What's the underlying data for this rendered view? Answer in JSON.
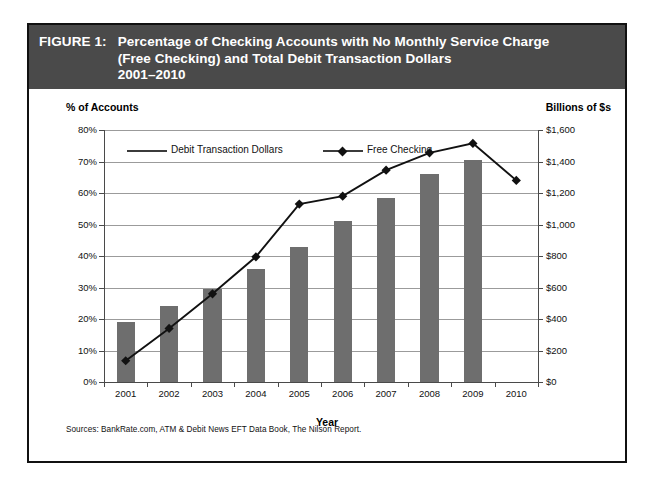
{
  "figure": {
    "label": "FIGURE 1:",
    "title_lines": [
      "Percentage of Checking Accounts with No Monthly Service Charge",
      "(Free Checking) and Total Debit Transaction Dollars",
      "2001–2010"
    ],
    "source_note": "Sources: BankRate.com, ATM & Debit News EFT Data Book, The Nilson Report.",
    "banner_color": "#4a4a4a",
    "bar_color": "#6e6e6e",
    "line_color": "#111111"
  },
  "legend": {
    "items": [
      {
        "label": "Debit Transaction Dollars",
        "marker": "line"
      },
      {
        "label": "Free Checking",
        "marker": "line-diamond"
      }
    ]
  },
  "chart_data": {
    "type": "bar",
    "title": "Percentage of Checking Accounts with No Monthly Service Charge (Free Checking) and Total Debit Transaction Dollars 2001–2010",
    "xlabel": "Year",
    "ylabel": "% of Accounts",
    "y2label": "Billions of $s",
    "categories": [
      "2001",
      "2002",
      "2003",
      "2004",
      "2005",
      "2006",
      "2007",
      "2008",
      "2009",
      "2010"
    ],
    "ylim": [
      0,
      80
    ],
    "y2lim": [
      0,
      1600
    ],
    "yticks": [
      "0%",
      "10%",
      "20%",
      "30%",
      "40%",
      "50%",
      "60%",
      "70%",
      "80%"
    ],
    "ytick_values": [
      0,
      10,
      20,
      30,
      40,
      50,
      60,
      70,
      80
    ],
    "y2ticks": [
      "$0",
      "$200",
      "$400",
      "$600",
      "$800",
      "$1,000",
      "$1,200",
      "$1,400",
      "$1,600"
    ],
    "y2tick_values": [
      0,
      200,
      400,
      600,
      800,
      1000,
      1200,
      1400,
      1600
    ],
    "grid": true,
    "legend_position": "top-left-inside",
    "series": [
      {
        "name": "Free Checking",
        "type": "bar",
        "axis": "left",
        "unit": "% of Accounts",
        "values": [
          19,
          24,
          29.5,
          36,
          43,
          51,
          58.5,
          66,
          70.5,
          null
        ]
      },
      {
        "name": "Debit Transaction Dollars",
        "type": "line",
        "axis": "right",
        "unit": "Billions of $s",
        "values": [
          135,
          340,
          560,
          795,
          1130,
          1180,
          1345,
          1455,
          1515,
          1280
        ]
      }
    ]
  }
}
